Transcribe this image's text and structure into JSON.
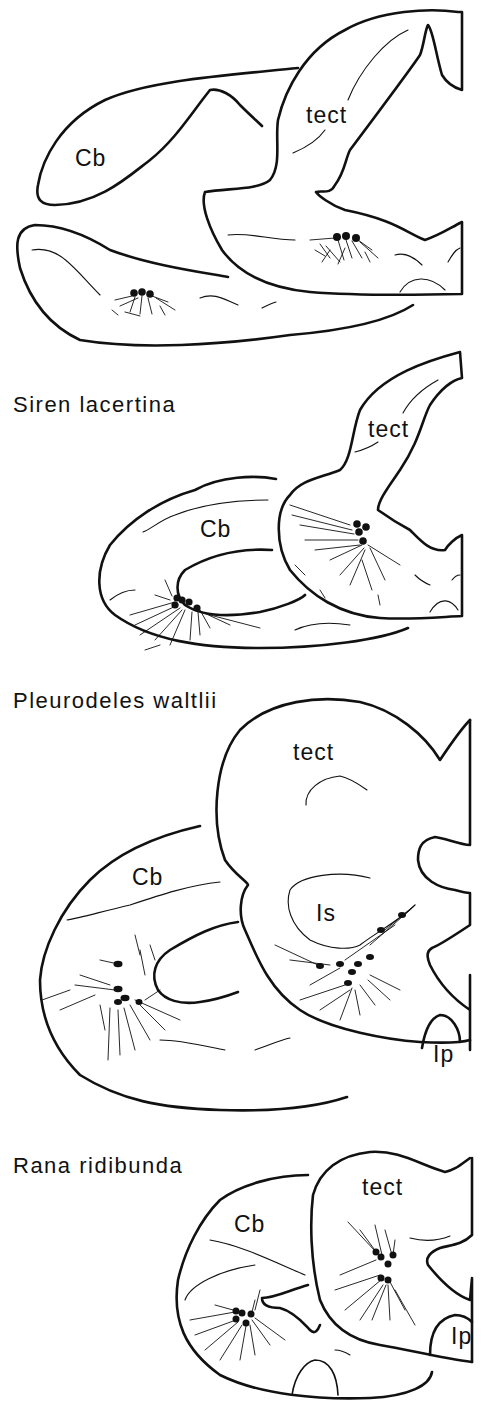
{
  "figure": {
    "panels": [
      {
        "species": "",
        "labels": {
          "cb": "Cb",
          "tect": "tect"
        }
      },
      {
        "species": "Siren lacertina",
        "labels": {
          "cb": "Cb",
          "tect": "tect"
        }
      },
      {
        "species": "Pleurodeles waltlii",
        "labels": {
          "cb": "Cb",
          "tect": "tect",
          "is": "Is",
          "ip": "Ip"
        }
      },
      {
        "species": "Rana ridibunda",
        "labels": {
          "cb": "Cb",
          "tect": "tect",
          "ip": "Ip"
        }
      }
    ],
    "colors": {
      "ink": "#111111",
      "background": "#ffffff"
    }
  }
}
